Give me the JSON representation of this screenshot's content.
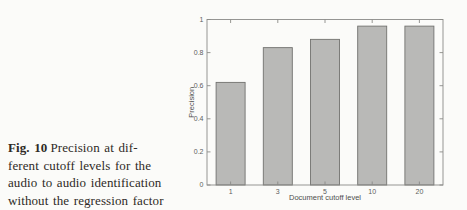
{
  "figure": {
    "caption": {
      "label": "Fig. 10",
      "lines": [
        "Precision at dif-",
        "ferent cutoff levels for the",
        "audio to audio identification",
        "without the regression factor"
      ]
    }
  },
  "chart_data": {
    "type": "bar",
    "title": "",
    "xlabel": "Document cutoff level",
    "ylabel": "Precision",
    "categories": [
      "1",
      "3",
      "5",
      "10",
      "20"
    ],
    "values": [
      0.62,
      0.83,
      0.88,
      0.96,
      0.96
    ],
    "ylim": [
      0,
      1
    ],
    "yticks": [
      0,
      0.2,
      0.4,
      0.6,
      0.8,
      1
    ],
    "ytick_labels": [
      "0",
      "0.2",
      "0.4",
      "0.6",
      "0.8",
      "1"
    ],
    "grid": false,
    "legend": null,
    "bar_color": "#b9b9b7",
    "bar_edge_color": "#72726f",
    "axis_color": "#8b8b88",
    "tick_text_color": "#5d5d5d"
  }
}
